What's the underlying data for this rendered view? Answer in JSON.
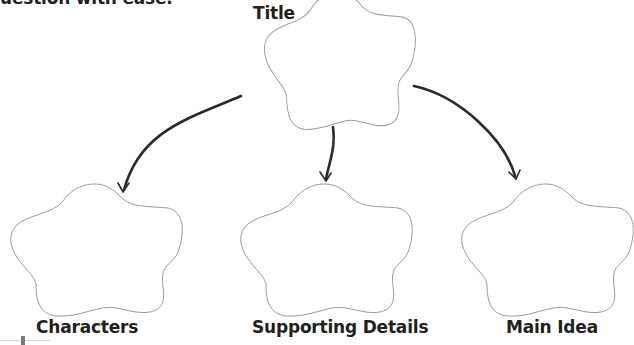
{
  "intro_text": "uestion with ease.",
  "diagram": {
    "type": "graphic-organizer",
    "root": {
      "label": "Title",
      "shape": "flower"
    },
    "children": [
      {
        "label": "Characters",
        "shape": "flower"
      },
      {
        "label": "Supporting Details",
        "shape": "flower"
      },
      {
        "label": "Main Idea",
        "shape": "flower"
      }
    ],
    "edges": [
      {
        "from": "Title",
        "to": "Characters",
        "style": "curved-arrow"
      },
      {
        "from": "Title",
        "to": "Supporting Details",
        "style": "arrow"
      },
      {
        "from": "Title",
        "to": "Main Idea",
        "style": "curved-arrow"
      }
    ],
    "colors": {
      "outline": "#9a9a9a",
      "arrow": "#2a2a2a",
      "text": "#231f20"
    }
  }
}
